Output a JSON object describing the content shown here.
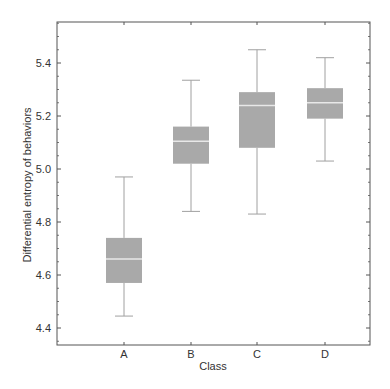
{
  "chart_data": {
    "type": "box",
    "title": "",
    "xlabel": "Class",
    "ylabel": "Differential entropy of behaviors",
    "categories": [
      "A",
      "B",
      "C",
      "D"
    ],
    "boxes": [
      {
        "category": "A",
        "whisker_low": 4.445,
        "q1": 4.57,
        "median": 4.66,
        "q3": 4.74,
        "whisker_high": 4.97
      },
      {
        "category": "B",
        "whisker_low": 4.84,
        "q1": 5.02,
        "median": 5.105,
        "q3": 5.16,
        "whisker_high": 5.335
      },
      {
        "category": "C",
        "whisker_low": 4.83,
        "q1": 5.08,
        "median": 5.24,
        "q3": 5.29,
        "whisker_high": 5.45
      },
      {
        "category": "D",
        "whisker_low": 5.03,
        "q1": 5.19,
        "median": 5.25,
        "q3": 5.305,
        "whisker_high": 5.42
      }
    ],
    "yticks": [
      4.4,
      4.6,
      4.8,
      5.0,
      5.2,
      5.4
    ],
    "ytick_labels": [
      "4.4",
      "4.6",
      "4.8",
      "5.0",
      "5.2",
      "5.4"
    ],
    "ylim": [
      4.335,
      5.555
    ],
    "grid": false,
    "legend": null,
    "colors": {
      "box_fill": "#a9a9a9",
      "median_line": "#e8e8e8",
      "whisker": "#a0a0a0",
      "axis": "#555555"
    }
  }
}
